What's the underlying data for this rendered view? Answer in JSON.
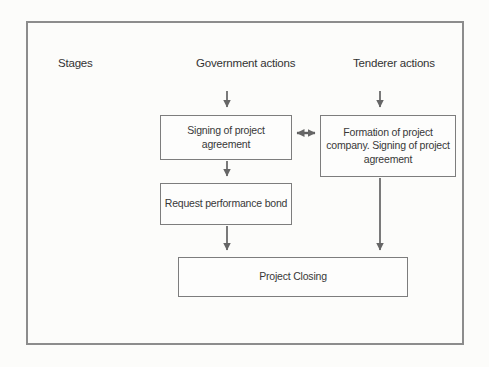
{
  "diagram": {
    "headers": {
      "stages": "Stages",
      "government": "Government actions",
      "tenderer": "Tenderer actions"
    },
    "nodes": {
      "signing": "Signing of project agreement",
      "formation": "Formation of project company. Signing of project agreement",
      "request_bond": "Request performance bond",
      "closing": "Project Closing"
    },
    "arrows": [
      {
        "name": "government-header-to-signing",
        "type": "down"
      },
      {
        "name": "tenderer-header-to-formation",
        "type": "down"
      },
      {
        "name": "signing-formation-link",
        "type": "double-horizontal"
      },
      {
        "name": "signing-to-request-bond",
        "type": "down"
      },
      {
        "name": "request-bond-to-closing",
        "type": "down"
      },
      {
        "name": "formation-to-closing",
        "type": "down"
      }
    ],
    "colors": {
      "frame_border": "#8c8c8c",
      "box_border": "#7d7d7d",
      "arrow": "#666666",
      "text": "#3a3a3a",
      "background": "#fcfcfa"
    }
  }
}
